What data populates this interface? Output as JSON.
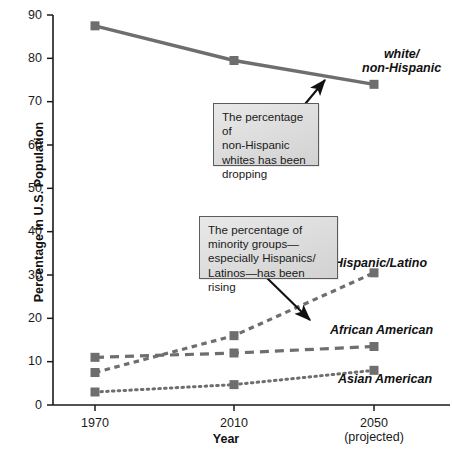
{
  "chart_data": {
    "type": "line",
    "title": "",
    "xlabel": "Year",
    "ylabel": "Percentage in U.S. Population",
    "categories": [
      "1970",
      "2010",
      "2050"
    ],
    "x_tick_sub": [
      "",
      "",
      "(projected)"
    ],
    "xlim": [
      0,
      2
    ],
    "ylim": [
      0,
      90
    ],
    "ytick_values": [
      0,
      10,
      20,
      30,
      40,
      50,
      60,
      70,
      80,
      90
    ],
    "ytick_labels": [
      "0",
      "10",
      "20",
      "30",
      "40",
      "50",
      "60",
      "70",
      "80",
      "90"
    ],
    "grid": false,
    "legend_position": "inline-right-of-series",
    "series": [
      {
        "name": "white/ non-Hispanic",
        "label_line_1": "white/",
        "label_line_2": "non-Hispanic",
        "style": "solid",
        "color": "#6e6e6e",
        "values": [
          87.5,
          79.5,
          74.0
        ]
      },
      {
        "name": "Hispanic/Latino",
        "label_line_1": "Hispanic/Latino",
        "label_line_2": "",
        "style": "dashed-short",
        "color": "#6e6e6e",
        "values": [
          7.5,
          16.0,
          30.5
        ]
      },
      {
        "name": "African American",
        "label_line_1": "African American",
        "label_line_2": "",
        "style": "dashed-long",
        "color": "#6e6e6e",
        "values": [
          11.0,
          12.0,
          13.5
        ]
      },
      {
        "name": "Asian American",
        "label_line_1": "Asian American",
        "label_line_2": "",
        "style": "dotted",
        "color": "#6e6e6e",
        "values": [
          3.0,
          4.7,
          8.0
        ]
      }
    ],
    "annotations": [
      {
        "id": "callout-white",
        "text": "The percentage of non-Hispanic whites has been dropping",
        "lines": [
          "The percentage of",
          "non-Hispanic",
          "whites has been",
          "dropping"
        ],
        "points_to": "white/ non-Hispanic line"
      },
      {
        "id": "callout-minority",
        "text": "The percentage of minority groups—especially Hispanics/Latinos—has been rising",
        "lines": [
          "The percentage of",
          "minority groups—",
          "especially Hispanics/",
          "Latinos—has been rising"
        ],
        "points_to": "Hispanic/Latino line"
      }
    ]
  },
  "axes": {
    "y_title": "Percentage in U.S. Population",
    "x_title": "Year"
  },
  "colors": {
    "line": "#6e6e6e",
    "marker": "#6e6e6e",
    "axis": "#1a1a1a",
    "callout_border": "#5c5c5c",
    "callout_fill": "#dcdcdc",
    "text": "#111111"
  }
}
